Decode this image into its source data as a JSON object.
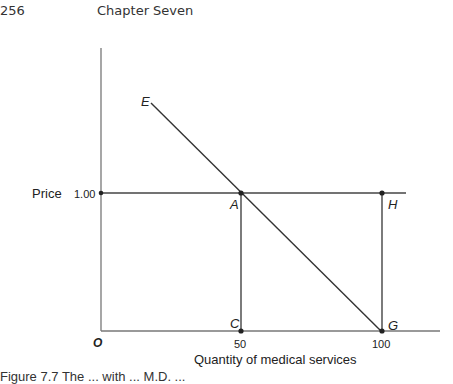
{
  "header": {
    "page_number": "256",
    "chapter_title": "Chapter Seven"
  },
  "figure": {
    "y_axis_label": "Price",
    "y_tick_label": "1.00",
    "x_axis_label": "Quantity of medical services",
    "x_tick_labels": [
      "50",
      "100"
    ],
    "origin_label": "O",
    "points": {
      "E": "E",
      "A": "A",
      "H": "H",
      "C": "C",
      "G": "G"
    }
  },
  "caption": "Figure 7.7 The ... with ... M.D. ..."
}
